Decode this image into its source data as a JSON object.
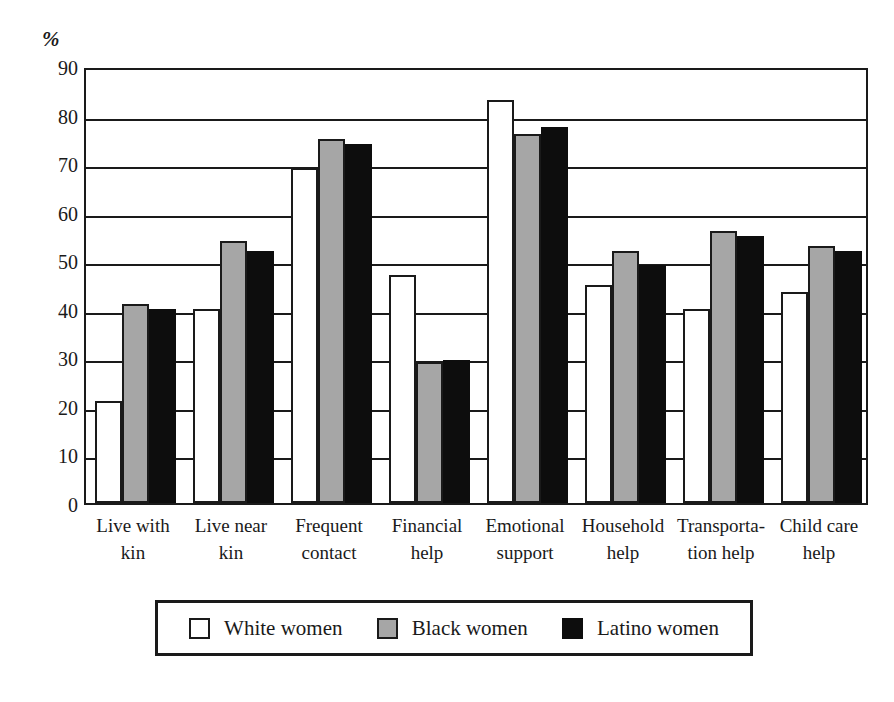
{
  "chart_data": {
    "type": "bar",
    "title": "",
    "subtitle": "",
    "xlabel": "",
    "ylabel": "%",
    "ylim": [
      0,
      90
    ],
    "ytick_values": [
      90,
      80,
      70,
      60,
      50,
      40,
      30,
      20,
      10,
      0
    ],
    "ytick_labels": [
      "90",
      "80",
      "70",
      "60",
      "50",
      "40",
      "30",
      "20",
      "10",
      "0"
    ],
    "grid": true,
    "grid_axis": "y",
    "legend_position": "bottom",
    "categories": [
      "Live with kin",
      "Live near kin",
      "Frequent contact",
      "Financial help",
      "Emotional support",
      "Household help",
      "Transportation help",
      "Child care help"
    ],
    "category_lines": [
      [
        "Live with",
        "kin"
      ],
      [
        "Live near",
        "kin"
      ],
      [
        "Frequent",
        "contact"
      ],
      [
        "Financial",
        "help"
      ],
      [
        "Emotional",
        "support"
      ],
      [
        "Household",
        "help"
      ],
      [
        "Transporta-",
        "tion help"
      ],
      [
        "Child care",
        "help"
      ]
    ],
    "series": [
      {
        "name": "White women",
        "color": "#ffffff",
        "values": [
          21,
          40,
          69,
          47,
          83,
          45,
          40,
          43.5
        ]
      },
      {
        "name": "Black women",
        "color": "#a6a6a6",
        "values": [
          41,
          54,
          75,
          29,
          76,
          52,
          56,
          53
        ]
      },
      {
        "name": "Latino women",
        "color": "#0d0d0d",
        "values": [
          40,
          52,
          74,
          29.5,
          77.5,
          49,
          55,
          52
        ]
      }
    ]
  },
  "legend": {
    "items": [
      {
        "label": "White women",
        "swatch": "white"
      },
      {
        "label": "Black women",
        "swatch": "gray"
      },
      {
        "label": "Latino women",
        "swatch": "black"
      }
    ]
  },
  "colors": {
    "ink": "#1a1a1a",
    "white_bar": "#ffffff",
    "gray_bar": "#a6a6a6",
    "black_bar": "#0d0d0d",
    "background": "#ffffff"
  }
}
